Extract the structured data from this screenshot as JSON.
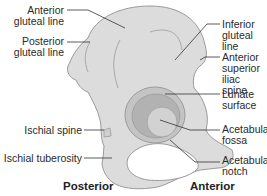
{
  "figure": {
    "colors": {
      "bone_fill": "#dcdcdc",
      "bone_outline": "#9a9a9a",
      "acetabulum_fill": "#b8b8b8",
      "fossa_fill": "#cfcfcf",
      "foramen_fill": "#ffffff",
      "leader_line": "#333333"
    }
  },
  "labels": {
    "left": [
      {
        "id": "anterior-gluteal-line",
        "line1": "Anterior",
        "line2": "gluteal line"
      },
      {
        "id": "posterior-gluteal-line",
        "line1": "Posterior",
        "line2": "gluteal line"
      },
      {
        "id": "ischial-spine",
        "line1": "Ischial spine"
      },
      {
        "id": "ischial-tuberosity",
        "line1": "Ischial tuberosity"
      }
    ],
    "right": [
      {
        "id": "inferior-gluteal-line",
        "line1": "Inferior",
        "line2": "gluteal line"
      },
      {
        "id": "anterior-superior-iliac-spine",
        "line1": "Anterior",
        "line2": "superior",
        "line3": "iliac spine"
      },
      {
        "id": "lunate-surface",
        "line1": "Lunate",
        "line2": "surface"
      },
      {
        "id": "acetabular-fossa",
        "line1": "Acetabular",
        "line2": "fossa"
      },
      {
        "id": "acetabular-notch",
        "line1": "Acetabular",
        "line2": "notch"
      }
    ]
  },
  "orientation": {
    "posterior": "Posterior",
    "anterior": "Anterior"
  }
}
